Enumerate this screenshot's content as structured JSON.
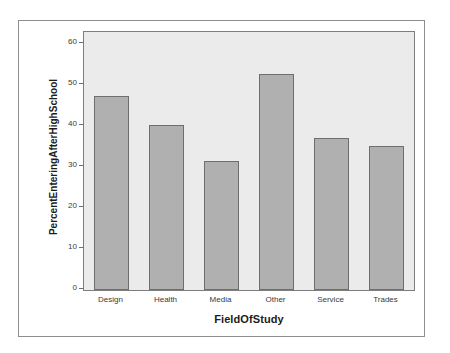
{
  "page": {
    "background_color": "#ffffff",
    "top_artifact_text": ""
  },
  "figure": {
    "frame_border_color": "#8e8e8e",
    "plot_background_color": "#ebebeb",
    "plot_border_color": "#7d7d7d"
  },
  "chart_data": {
    "type": "bar",
    "title": "",
    "categories": [
      "Design",
      "Health",
      "Media",
      "Other",
      "Service",
      "Trades"
    ],
    "values": [
      47.3,
      40.4,
      31.5,
      52.8,
      37.0,
      35.2
    ],
    "xlabel": "FieldOfStudy",
    "ylabel": "PercentEnteringAfterHighSchool",
    "ylim": [
      0,
      63
    ],
    "yticks": [
      0,
      10,
      20,
      30,
      40,
      50,
      60
    ],
    "ytick_labels": [
      "0",
      "10",
      "20",
      "30",
      "40",
      "50",
      "60"
    ],
    "grid": false,
    "legend": false,
    "bar_color": "#b0b0b0",
    "bar_edge_color": "#6e6e6e"
  }
}
